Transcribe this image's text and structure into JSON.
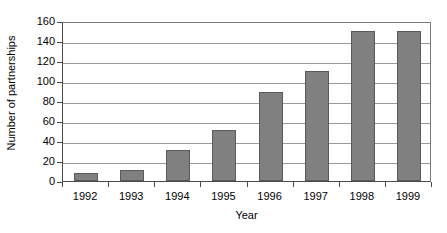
{
  "chart_data": {
    "type": "bar",
    "title": "",
    "xlabel": "Year",
    "ylabel": "Number of partnerships",
    "categories": [
      "1992",
      "1993",
      "1994",
      "1995",
      "1996",
      "1997",
      "1998",
      "1999"
    ],
    "values": [
      8,
      11,
      31,
      51,
      89,
      110,
      150,
      150
    ],
    "ylim": [
      0,
      160
    ],
    "yticks": [
      0,
      20,
      40,
      60,
      80,
      100,
      120,
      140,
      160
    ],
    "ytick_labels": [
      "0",
      "20",
      "40",
      "60",
      "80",
      "100",
      "120",
      "140",
      "160"
    ],
    "grid": true,
    "legend": false,
    "series": [
      {
        "name": "Number of partnerships",
        "values": [
          8,
          11,
          31,
          51,
          89,
          110,
          150,
          150
        ],
        "color": "#808080"
      }
    ],
    "bar_color": "#808080",
    "bar_edge_color": "#5a5a5a",
    "gridline_color": "#9a9a9a",
    "axis_color": "#4a4a4a",
    "background": "#ffffff"
  }
}
